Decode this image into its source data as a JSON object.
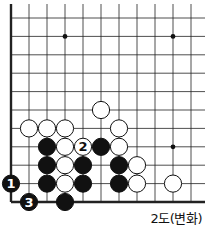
{
  "caption": "2도(변화)",
  "board": {
    "columns": 11,
    "rows": 11,
    "origin_x": 11,
    "origin_y": 18,
    "spacing_x": 18,
    "spacing_y": 18.4,
    "left_edge": true,
    "bottom_edge": true,
    "star_points": [
      [
        3,
        1
      ],
      [
        9,
        1
      ],
      [
        9,
        7
      ]
    ],
    "stones": [
      {
        "color": "white",
        "col": 5,
        "row": 5
      },
      {
        "color": "white",
        "col": 1,
        "row": 6
      },
      {
        "color": "white",
        "col": 2,
        "row": 6
      },
      {
        "color": "white",
        "col": 3,
        "row": 6
      },
      {
        "color": "white",
        "col": 6,
        "row": 6
      },
      {
        "color": "black",
        "col": 2,
        "row": 7
      },
      {
        "color": "white",
        "col": 3,
        "row": 7
      },
      {
        "color": "white",
        "col": 4,
        "row": 7,
        "label": "2"
      },
      {
        "color": "black",
        "col": 5,
        "row": 7
      },
      {
        "color": "white",
        "col": 6,
        "row": 7
      },
      {
        "color": "black",
        "col": 2,
        "row": 8
      },
      {
        "color": "white",
        "col": 3,
        "row": 8
      },
      {
        "color": "black",
        "col": 4,
        "row": 8
      },
      {
        "color": "black",
        "col": 6,
        "row": 8
      },
      {
        "color": "white",
        "col": 7,
        "row": 8
      },
      {
        "color": "black",
        "col": 0,
        "row": 9,
        "label": "1"
      },
      {
        "color": "black",
        "col": 2,
        "row": 9
      },
      {
        "color": "white",
        "col": 3,
        "row": 9
      },
      {
        "color": "black",
        "col": 4,
        "row": 9
      },
      {
        "color": "black",
        "col": 6,
        "row": 9
      },
      {
        "color": "white",
        "col": 7,
        "row": 9
      },
      {
        "color": "white",
        "col": 9,
        "row": 9
      },
      {
        "color": "black",
        "col": 1,
        "row": 10,
        "label": "3"
      },
      {
        "color": "black",
        "col": 3,
        "row": 10
      }
    ]
  }
}
